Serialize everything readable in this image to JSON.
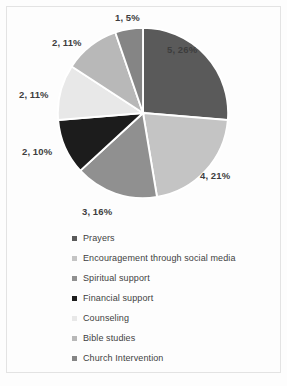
{
  "chart_data": {
    "type": "pie",
    "title": "",
    "subtitle": "",
    "xlabel": "",
    "ylabel": "",
    "grid": false,
    "legend_position": "bottom",
    "categories": [
      "Prayers",
      "Encouragement through social media",
      "Spiritual support",
      "Financial support",
      "Counseling",
      "Bible studies",
      "Church Intervention"
    ],
    "values": [
      5,
      4,
      3,
      2,
      2,
      2,
      1
    ],
    "percentages": [
      26,
      21,
      16,
      10,
      11,
      11,
      5
    ],
    "data_labels": [
      "5, 26%",
      "4, 21%",
      "3, 16%",
      "2, 10%",
      "2, 11%",
      "2, 11%",
      "1, 5%"
    ],
    "colors": [
      "#5a5a5a",
      "#c4c4c4",
      "#909090",
      "#1c1c1c",
      "#e8e8e8",
      "#b8b8b8",
      "#858585"
    ],
    "slice_border_color": "#ffffff",
    "total": 19
  },
  "labels": {
    "prayers": "5, 26%",
    "encouragement": "4, 21%",
    "spiritual": "3, 16%",
    "financial": "2, 10%",
    "counseling": "2, 11%",
    "bible": "2, 11%",
    "church": "1, 5%"
  },
  "legend": {
    "items": [
      {
        "label": "Prayers",
        "color": "#5a5a5a"
      },
      {
        "label": "Encouragement through social media",
        "color": "#c4c4c4"
      },
      {
        "label": "Spiritual support",
        "color": "#909090"
      },
      {
        "label": "Financial support",
        "color": "#1c1c1c"
      },
      {
        "label": "Counseling",
        "color": "#e8e8e8"
      },
      {
        "label": "Bible studies",
        "color": "#b8b8b8"
      },
      {
        "label": "Church Intervention",
        "color": "#858585"
      }
    ]
  }
}
